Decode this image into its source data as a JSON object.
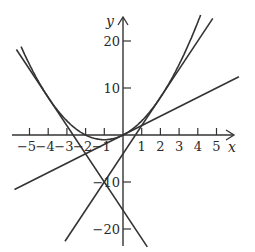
{
  "chart_data": {
    "type": "line",
    "title": "",
    "xlabel": "x",
    "ylabel": "y",
    "xlim": [
      -5.5,
      6
    ],
    "ylim": [
      -23,
      26
    ],
    "grid": false,
    "legend": null,
    "x_ticks": [
      "-5",
      "-4",
      "-3",
      "-2",
      "-1",
      "1",
      "2",
      "3",
      "4",
      "5"
    ],
    "y_ticks": [
      "20",
      "10",
      "-10",
      "-20"
    ],
    "series": [
      {
        "name": "y = x^2 + 2x",
        "kind": "parabola",
        "x": [
          -5.5,
          -5,
          -4,
          -3,
          -2,
          -1,
          0,
          1,
          2,
          3,
          4
        ],
        "y": [
          19.25,
          15,
          8,
          3,
          0,
          -1,
          0,
          3,
          8,
          15,
          24
        ]
      },
      {
        "name": "y = 2x",
        "kind": "tangent-line",
        "x": [
          -5.8,
          6.2
        ],
        "y": [
          -11.6,
          12.4
        ]
      },
      {
        "name": "y = 6x - 4",
        "kind": "tangent-line",
        "x": [
          -3.1,
          4.8
        ],
        "y": [
          -22.6,
          24.8
        ]
      },
      {
        "name": "y = -6x - 16",
        "kind": "tangent-line",
        "x": [
          -5.7,
          1.3
        ],
        "y": [
          18.2,
          -23.8
        ]
      }
    ]
  },
  "axes": {
    "x_label": "x",
    "y_label": "y",
    "x_tick_labels": [
      "−5",
      "−4",
      "−3",
      "−2",
      "−1",
      "1",
      "2",
      "3",
      "4",
      "5"
    ],
    "y_tick_labels": [
      "20",
      "10",
      "−10",
      "−20"
    ]
  }
}
